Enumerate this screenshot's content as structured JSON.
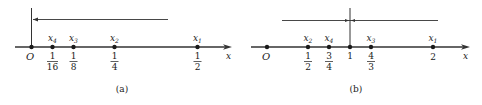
{
  "panel_a": {
    "caption": "(a)",
    "axis_label": "x",
    "origin_label": "O",
    "points": [
      {
        "name": "x",
        "sub": "4",
        "num": "1",
        "den": "16"
      },
      {
        "name": "x",
        "sub": "3",
        "num": "1",
        "den": "8"
      },
      {
        "name": "x",
        "sub": "2",
        "num": "1",
        "den": "4"
      },
      {
        "name": "x",
        "sub": "1",
        "num": "1",
        "den": "2"
      }
    ]
  },
  "panel_b": {
    "caption": "(b)",
    "axis_label": "x",
    "origin_label": "O",
    "points": [
      {
        "name": "x",
        "sub": "2",
        "num": "1",
        "den": "2"
      },
      {
        "name": "x",
        "sub": "4",
        "num": "3",
        "den": "4"
      },
      {
        "name": "",
        "sub": "",
        "value": "1"
      },
      {
        "name": "x",
        "sub": "3",
        "num": "4",
        "den": "3"
      },
      {
        "name": "x",
        "sub": "1",
        "value": "2"
      }
    ]
  },
  "colors": {
    "ink": "#1a1a1a",
    "line": "#333333"
  }
}
